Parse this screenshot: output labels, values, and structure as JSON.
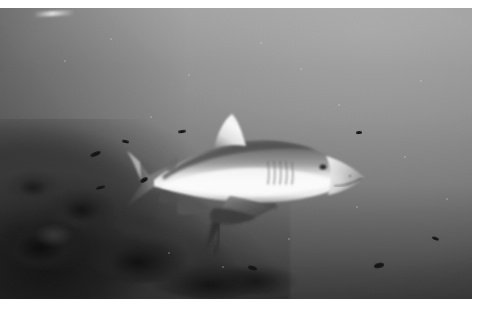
{
  "photo": {
    "medium": "black-and-white photographic print",
    "scene": "underwater",
    "caption": "Grey reef shark swimming above a coral reef in open water",
    "border": {
      "paper_color": "#ffffff",
      "top_px": 8,
      "right_px": 5,
      "bottom_px": 11,
      "left_px": 0
    },
    "tonal_range": {
      "brightest": "#f2f2f2",
      "water_highlight": "#a4a4a4",
      "water_midtone": "#787878",
      "water_shadow": "#545454",
      "reef_shadow": "#181818",
      "darkest": "#0e0e0e"
    },
    "artifacts": [
      {
        "name": "emulsion-scratch",
        "position": "top edge, left of center"
      }
    ]
  },
  "water": {
    "label": "open water column",
    "light_direction": "from upper right",
    "gradient_from": "#a4a4a4",
    "gradient_to": "#545454"
  },
  "subject": {
    "label": "grey reef shark",
    "facing": "right",
    "body_tone": "#8d8d8d",
    "belly_tone": "#f0f0f0",
    "dorsal_tone": "#6e6e6e",
    "parts": [
      {
        "name": "first-dorsal-fin",
        "tone": "#efefef"
      },
      {
        "name": "caudal-fin",
        "tone": "#4a4a4a"
      },
      {
        "name": "pectoral-fin-near",
        "tone": "#5e5e5e"
      },
      {
        "name": "pectoral-fin-far",
        "tone": "#6a6a6a"
      },
      {
        "name": "pelvic-fin",
        "tone": "#525252"
      },
      {
        "name": "second-dorsal-fin",
        "tone": "#5a5a5a"
      },
      {
        "name": "anal-fin",
        "tone": "#585858"
      },
      {
        "name": "snout",
        "tone": "#b8b8b8"
      },
      {
        "name": "eye",
        "tone": "#1a1a1a"
      },
      {
        "name": "mouth",
        "tone": "#3c3c3c"
      },
      {
        "name": "gill-slits",
        "count": 5,
        "tone": "#6a6a6a"
      }
    ]
  },
  "remora": {
    "label": "remora attached beneath shark",
    "tone": "#3a3a3a"
  },
  "reef": {
    "label": "coral reef outcrop",
    "position": "lower left",
    "tone": "#202020",
    "features": [
      {
        "name": "coral-head-upper-ridge"
      },
      {
        "name": "coral-head-mid-boulder"
      },
      {
        "name": "coral-rubble-foreground"
      },
      {
        "name": "reef-slope-falloff"
      }
    ]
  },
  "small_fish": {
    "label": "small fish silhouettes in water column",
    "count": 9,
    "tone": "#181818",
    "items": [
      {
        "name": "fish-upper-left",
        "x": 90,
        "y": 152,
        "w": 11,
        "h": 4,
        "rot": -22
      },
      {
        "name": "fish-left-low",
        "x": 96,
        "y": 186,
        "w": 9,
        "h": 3,
        "rot": -14
      },
      {
        "name": "fish-mid-left",
        "x": 122,
        "y": 140,
        "w": 7,
        "h": 3,
        "rot": 12
      },
      {
        "name": "fish-near-reef",
        "x": 140,
        "y": 178,
        "w": 8,
        "h": 4,
        "rot": -30
      },
      {
        "name": "fish-above-dorsal",
        "x": 178,
        "y": 130,
        "w": 8,
        "h": 3,
        "rot": -8
      },
      {
        "name": "fish-lower-center",
        "x": 248,
        "y": 266,
        "w": 9,
        "h": 4,
        "rot": 16
      },
      {
        "name": "fish-right-low",
        "x": 374,
        "y": 263,
        "w": 10,
        "h": 5,
        "rot": -12
      },
      {
        "name": "fish-far-right",
        "x": 432,
        "y": 237,
        "w": 7,
        "h": 3,
        "rot": 20
      },
      {
        "name": "fish-top-right",
        "x": 356,
        "y": 131,
        "w": 6,
        "h": 3,
        "rot": -5
      }
    ]
  },
  "particulates": {
    "label": "suspended marine snow",
    "count": 14
  }
}
